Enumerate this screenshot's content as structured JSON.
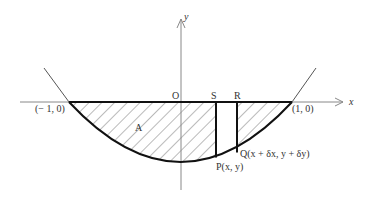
{
  "figure": {
    "axes": {
      "x_label": "x",
      "y_label": "y",
      "origin_label": "O"
    },
    "points": {
      "left_root": "(− 1, 0)",
      "right_root": "(1, 0)",
      "S": "S",
      "R": "R",
      "P": "P(x, y)",
      "Q": "Q(x + δx, y + δy)"
    },
    "region_label": "A",
    "colors": {
      "curve": "#111111",
      "axes": "#777777",
      "hatch": "#666666",
      "background": "#ffffff"
    }
  }
}
